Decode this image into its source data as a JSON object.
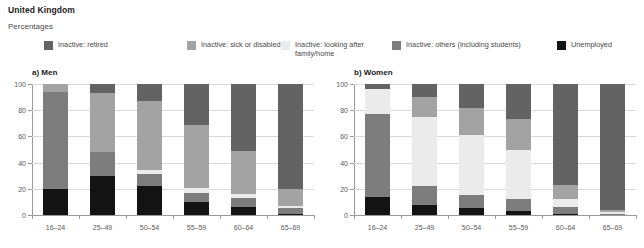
{
  "header": {
    "title": "United Kingdom",
    "subtitle": "Percentages"
  },
  "legend": {
    "items": [
      {
        "label": "Inactive: retired",
        "color": "#636363",
        "x": 0,
        "w": 120
      },
      {
        "label": "Inactive: sick or disabled",
        "color": "#a3a3a3",
        "x": 143,
        "w": 150
      },
      {
        "label": "Inactive: looking after\nfamily/home",
        "color": "#ebebeb",
        "x": 237,
        "w": 110
      },
      {
        "label": "Inactive: others (including students)",
        "color": "#7d7d7d",
        "x": 348,
        "w": 185
      },
      {
        "label": "Unemployed",
        "color": "#131313",
        "x": 513,
        "w": 90
      }
    ]
  },
  "chart_data": [
    {
      "type": "bar",
      "subtype": "stacked-bar",
      "title": "a) Men",
      "panel": "a",
      "xlabel": "",
      "ylabel": "Percentages",
      "ylim": [
        0,
        100
      ],
      "yticks": [
        0,
        20,
        40,
        60,
        80,
        100
      ],
      "grid": true,
      "legend_position": "top",
      "categories": [
        "16–24",
        "25–49",
        "50–54",
        "55–59",
        "60–64",
        "65–69"
      ],
      "series": [
        {
          "name": "Unemployed",
          "color": "#131313",
          "values": [
            20,
            30,
            22,
            10,
            6,
            1
          ]
        },
        {
          "name": "Inactive: others (including students)",
          "color": "#7d7d7d",
          "values": [
            74,
            18,
            9,
            7,
            7,
            4
          ]
        },
        {
          "name": "Inactive: looking after family/home",
          "color": "#ebebeb",
          "values": [
            0,
            0,
            3,
            4,
            3,
            2
          ]
        },
        {
          "name": "Inactive: sick or disabled",
          "color": "#a3a3a3",
          "values": [
            6,
            45,
            53,
            48,
            33,
            13
          ]
        },
        {
          "name": "Inactive: retired",
          "color": "#636363",
          "values": [
            0,
            7,
            13,
            31,
            51,
            80
          ]
        }
      ]
    },
    {
      "type": "bar",
      "subtype": "stacked-bar",
      "title": "b) Women",
      "panel": "b",
      "xlabel": "",
      "ylabel": "Percentages",
      "ylim": [
        0,
        100
      ],
      "yticks": [
        0,
        20,
        40,
        60,
        80,
        100
      ],
      "grid": true,
      "legend_position": "top",
      "categories": [
        "16–24",
        "25–49",
        "50–54",
        "55–59",
        "60–64",
        "65–69"
      ],
      "series": [
        {
          "name": "Unemployed",
          "color": "#131313",
          "values": [
            14,
            8,
            5,
            3,
            1,
            0
          ]
        },
        {
          "name": "Inactive: others (including students)",
          "color": "#7d7d7d",
          "values": [
            63,
            14,
            10,
            9,
            5,
            1
          ]
        },
        {
          "name": "Inactive: looking after family/home",
          "color": "#ebebeb",
          "values": [
            19,
            53,
            46,
            38,
            6,
            1
          ]
        },
        {
          "name": "Inactive: sick or disabled",
          "color": "#a3a3a3",
          "values": [
            0,
            15,
            21,
            23,
            11,
            2
          ]
        },
        {
          "name": "Inactive: retired",
          "color": "#636363",
          "values": [
            4,
            10,
            18,
            27,
            77,
            96
          ]
        }
      ]
    }
  ]
}
